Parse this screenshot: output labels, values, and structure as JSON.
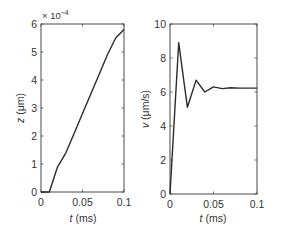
{
  "chart_data": [
    {
      "type": "line",
      "title": "",
      "xlabel": "t (ms)",
      "ylabel": "z (μm)",
      "y_multiplier": "× 10^-4",
      "xlim": [
        0,
        0.1
      ],
      "ylim": [
        0,
        6
      ],
      "xticks": [
        0,
        0.05,
        0.1
      ],
      "xtick_labels": [
        "0",
        "0.05",
        "0.1"
      ],
      "yticks": [
        0,
        1,
        2,
        3,
        4,
        5,
        6
      ],
      "ytick_labels": [
        "0",
        "1",
        "2",
        "3",
        "4",
        "5",
        "6"
      ],
      "grid": false,
      "legend": null,
      "series": [
        {
          "name": "z",
          "x": [
            0,
            0.01,
            0.02,
            0.03,
            0.04,
            0.05,
            0.06,
            0.07,
            0.08,
            0.09,
            0.1
          ],
          "values": [
            0,
            0,
            0.9,
            1.4,
            2.1,
            2.8,
            3.5,
            4.2,
            4.9,
            5.5,
            5.8
          ]
        }
      ]
    },
    {
      "type": "line",
      "title": "",
      "xlabel": "t (ms)",
      "ylabel": "v (μm/s)",
      "xlim": [
        0,
        0.1
      ],
      "ylim": [
        0,
        10
      ],
      "xticks": [
        0,
        0.05,
        0.1
      ],
      "xtick_labels": [
        "0",
        "0.05",
        "0.1"
      ],
      "yticks": [
        0,
        2,
        4,
        6,
        8,
        10
      ],
      "ytick_labels": [
        "0",
        "2",
        "4",
        "6",
        "8",
        "10"
      ],
      "grid": false,
      "legend": null,
      "series": [
        {
          "name": "v",
          "x": [
            0,
            0.01,
            0.02,
            0.03,
            0.04,
            0.05,
            0.06,
            0.07,
            0.08,
            0.1
          ],
          "values": [
            0,
            8.9,
            5.1,
            6.7,
            6.0,
            6.3,
            6.2,
            6.25,
            6.23,
            6.23
          ]
        }
      ]
    }
  ],
  "left": {
    "multiplier_prefix": "× 10",
    "multiplier_exp": "−4",
    "ylabel_var": "z",
    "ylabel_unit": " (μm)",
    "xlabel_var": "t",
    "xlabel_unit": " (ms)"
  },
  "right": {
    "ylabel_var": "v",
    "ylabel_unit": "  (μm/s)",
    "xlabel_var": "t",
    "xlabel_unit": " (ms)"
  }
}
